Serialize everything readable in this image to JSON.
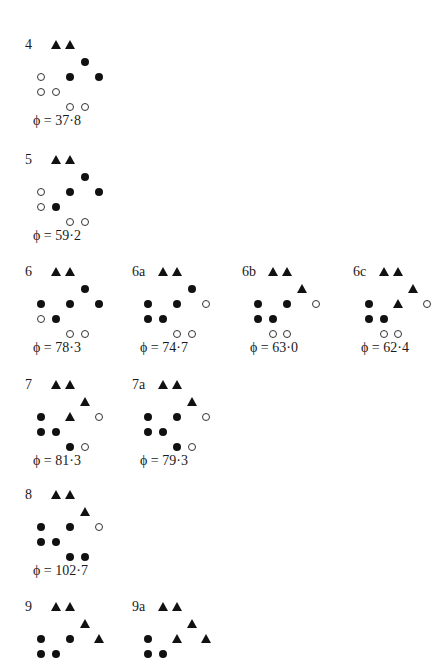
{
  "figure": {
    "grid": {
      "col_spacing": 14.5,
      "row_spacing": 15,
      "col0_offset": 16
    },
    "configurations": [
      {
        "label": "4",
        "x": 25,
        "y": 45,
        "phi": "ϕ = 37·8",
        "cells": [
          {
            "row": 0,
            "col": 1,
            "type": "triangle"
          },
          {
            "row": 0,
            "col": 2,
            "type": "triangle"
          },
          {
            "row": 1,
            "col": 3,
            "type": "filled"
          },
          {
            "row": 2,
            "col": 0,
            "type": "open"
          },
          {
            "row": 2,
            "col": 2,
            "type": "filled"
          },
          {
            "row": 2,
            "col": 4,
            "type": "filled"
          },
          {
            "row": 3,
            "col": 0,
            "type": "open"
          },
          {
            "row": 3,
            "col": 1,
            "type": "open"
          },
          {
            "row": 4,
            "col": 2,
            "type": "open"
          },
          {
            "row": 4,
            "col": 3,
            "type": "open"
          }
        ]
      },
      {
        "label": "5",
        "x": 25,
        "y": 160,
        "phi": "ϕ = 59·2",
        "cells": [
          {
            "row": 0,
            "col": 1,
            "type": "triangle"
          },
          {
            "row": 0,
            "col": 2,
            "type": "triangle"
          },
          {
            "row": 1,
            "col": 3,
            "type": "filled"
          },
          {
            "row": 2,
            "col": 0,
            "type": "open"
          },
          {
            "row": 2,
            "col": 2,
            "type": "filled"
          },
          {
            "row": 2,
            "col": 4,
            "type": "filled"
          },
          {
            "row": 3,
            "col": 0,
            "type": "open"
          },
          {
            "row": 3,
            "col": 1,
            "type": "filled"
          },
          {
            "row": 4,
            "col": 2,
            "type": "open"
          },
          {
            "row": 4,
            "col": 3,
            "type": "open"
          }
        ]
      },
      {
        "label": "6",
        "x": 25,
        "y": 272,
        "phi": "ϕ = 78·3",
        "cells": [
          {
            "row": 0,
            "col": 1,
            "type": "triangle"
          },
          {
            "row": 0,
            "col": 2,
            "type": "triangle"
          },
          {
            "row": 1,
            "col": 3,
            "type": "filled"
          },
          {
            "row": 2,
            "col": 0,
            "type": "filled"
          },
          {
            "row": 2,
            "col": 2,
            "type": "filled"
          },
          {
            "row": 2,
            "col": 4,
            "type": "filled"
          },
          {
            "row": 3,
            "col": 0,
            "type": "open"
          },
          {
            "row": 3,
            "col": 1,
            "type": "filled"
          },
          {
            "row": 4,
            "col": 2,
            "type": "open"
          },
          {
            "row": 4,
            "col": 3,
            "type": "open"
          }
        ]
      },
      {
        "label": "6a",
        "x": 132,
        "y": 272,
        "phi": "ϕ = 74·7",
        "cells": [
          {
            "row": 0,
            "col": 1,
            "type": "triangle"
          },
          {
            "row": 0,
            "col": 2,
            "type": "triangle"
          },
          {
            "row": 1,
            "col": 3,
            "type": "filled"
          },
          {
            "row": 2,
            "col": 0,
            "type": "filled"
          },
          {
            "row": 2,
            "col": 2,
            "type": "filled"
          },
          {
            "row": 2,
            "col": 4,
            "type": "open"
          },
          {
            "row": 3,
            "col": 0,
            "type": "filled"
          },
          {
            "row": 3,
            "col": 1,
            "type": "filled"
          },
          {
            "row": 4,
            "col": 2,
            "type": "open"
          },
          {
            "row": 4,
            "col": 3,
            "type": "open"
          }
        ]
      },
      {
        "label": "6b",
        "x": 242,
        "y": 272,
        "phi": "ϕ = 63·0",
        "cells": [
          {
            "row": 0,
            "col": 1,
            "type": "triangle"
          },
          {
            "row": 0,
            "col": 2,
            "type": "triangle"
          },
          {
            "row": 1,
            "col": 3,
            "type": "triangle"
          },
          {
            "row": 2,
            "col": 0,
            "type": "filled"
          },
          {
            "row": 2,
            "col": 2,
            "type": "filled"
          },
          {
            "row": 2,
            "col": 4,
            "type": "open"
          },
          {
            "row": 3,
            "col": 0,
            "type": "filled"
          },
          {
            "row": 3,
            "col": 1,
            "type": "filled"
          },
          {
            "row": 4,
            "col": 1,
            "type": "open"
          },
          {
            "row": 4,
            "col": 2,
            "type": "open"
          }
        ]
      },
      {
        "label": "6c",
        "x": 353,
        "y": 272,
        "phi": "ϕ = 62·4",
        "cells": [
          {
            "row": 0,
            "col": 1,
            "type": "triangle"
          },
          {
            "row": 0,
            "col": 2,
            "type": "triangle"
          },
          {
            "row": 1,
            "col": 3,
            "type": "triangle"
          },
          {
            "row": 2,
            "col": 0,
            "type": "filled"
          },
          {
            "row": 2,
            "col": 2,
            "type": "triangle"
          },
          {
            "row": 2,
            "col": 4,
            "type": "open"
          },
          {
            "row": 3,
            "col": 0,
            "type": "filled"
          },
          {
            "row": 3,
            "col": 1,
            "type": "filled"
          },
          {
            "row": 4,
            "col": 1,
            "type": "open"
          },
          {
            "row": 4,
            "col": 2,
            "type": "open"
          }
        ]
      },
      {
        "label": "7",
        "x": 25,
        "y": 385,
        "phi": "ϕ = 81·3",
        "cells": [
          {
            "row": 0,
            "col": 1,
            "type": "triangle"
          },
          {
            "row": 0,
            "col": 2,
            "type": "triangle"
          },
          {
            "row": 1,
            "col": 3,
            "type": "triangle"
          },
          {
            "row": 2,
            "col": 0,
            "type": "filled"
          },
          {
            "row": 2,
            "col": 2,
            "type": "triangle"
          },
          {
            "row": 2,
            "col": 4,
            "type": "open"
          },
          {
            "row": 3,
            "col": 0,
            "type": "filled"
          },
          {
            "row": 3,
            "col": 1,
            "type": "filled"
          },
          {
            "row": 4,
            "col": 2,
            "type": "filled"
          },
          {
            "row": 4,
            "col": 3,
            "type": "open"
          }
        ]
      },
      {
        "label": "7a",
        "x": 132,
        "y": 385,
        "phi": "ϕ = 79·3",
        "cells": [
          {
            "row": 0,
            "col": 1,
            "type": "triangle"
          },
          {
            "row": 0,
            "col": 2,
            "type": "triangle"
          },
          {
            "row": 1,
            "col": 3,
            "type": "triangle"
          },
          {
            "row": 2,
            "col": 0,
            "type": "filled"
          },
          {
            "row": 2,
            "col": 2,
            "type": "filled"
          },
          {
            "row": 2,
            "col": 4,
            "type": "open"
          },
          {
            "row": 3,
            "col": 0,
            "type": "filled"
          },
          {
            "row": 3,
            "col": 1,
            "type": "filled"
          },
          {
            "row": 4,
            "col": 2,
            "type": "filled"
          },
          {
            "row": 4,
            "col": 3,
            "type": "open"
          }
        ]
      },
      {
        "label": "8",
        "x": 25,
        "y": 495,
        "phi": "ϕ = 102·7",
        "cells": [
          {
            "row": 0,
            "col": 1,
            "type": "triangle"
          },
          {
            "row": 0,
            "col": 2,
            "type": "triangle"
          },
          {
            "row": 1,
            "col": 3,
            "type": "triangle"
          },
          {
            "row": 2,
            "col": 0,
            "type": "filled"
          },
          {
            "row": 2,
            "col": 2,
            "type": "filled"
          },
          {
            "row": 2,
            "col": 4,
            "type": "open"
          },
          {
            "row": 3,
            "col": 0,
            "type": "filled"
          },
          {
            "row": 3,
            "col": 1,
            "type": "filled"
          },
          {
            "row": 4,
            "col": 2,
            "type": "filled"
          },
          {
            "row": 4,
            "col": 3,
            "type": "filled"
          }
        ]
      },
      {
        "label": "9",
        "x": 25,
        "y": 607,
        "phi": "",
        "cells": [
          {
            "row": 0,
            "col": 1,
            "type": "triangle"
          },
          {
            "row": 0,
            "col": 2,
            "type": "triangle"
          },
          {
            "row": 1,
            "col": 3,
            "type": "triangle"
          },
          {
            "row": 2,
            "col": 0,
            "type": "filled"
          },
          {
            "row": 2,
            "col": 2,
            "type": "filled"
          },
          {
            "row": 2,
            "col": 4,
            "type": "triangle"
          },
          {
            "row": 3,
            "col": 0,
            "type": "filled"
          },
          {
            "row": 3,
            "col": 1,
            "type": "filled"
          }
        ]
      },
      {
        "label": "9a",
        "x": 132,
        "y": 607,
        "phi": "",
        "cells": [
          {
            "row": 0,
            "col": 1,
            "type": "triangle"
          },
          {
            "row": 0,
            "col": 2,
            "type": "triangle"
          },
          {
            "row": 1,
            "col": 3,
            "type": "triangle"
          },
          {
            "row": 2,
            "col": 0,
            "type": "filled"
          },
          {
            "row": 2,
            "col": 2,
            "type": "triangle"
          },
          {
            "row": 2,
            "col": 4,
            "type": "triangle"
          },
          {
            "row": 3,
            "col": 0,
            "type": "filled"
          },
          {
            "row": 3,
            "col": 1,
            "type": "filled"
          }
        ]
      }
    ]
  }
}
